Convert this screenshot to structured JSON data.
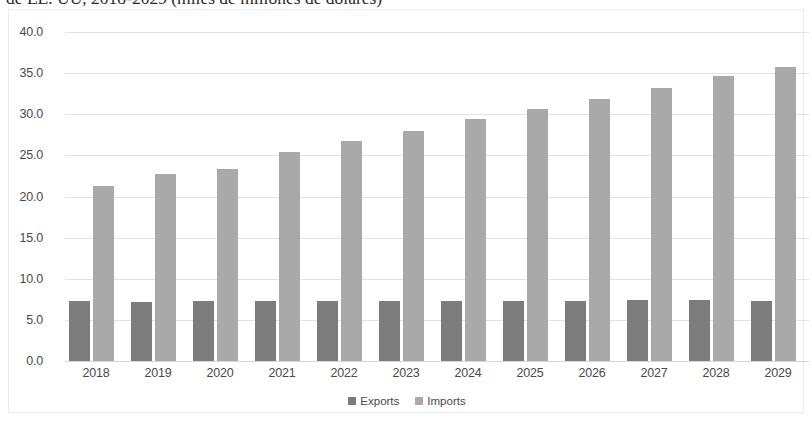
{
  "chart_data": {
    "type": "bar",
    "title": "de EE. UU, 2018-2029 (miles de millones de dólares)",
    "xlabel": "",
    "ylabel": "",
    "ylim": [
      0,
      40
    ],
    "ytick_step": 5,
    "grid": true,
    "legend_position": "bottom",
    "categories": [
      "2018",
      "2019",
      "2020",
      "2021",
      "2022",
      "2023",
      "2024",
      "2025",
      "2026",
      "2027",
      "2028",
      "2029"
    ],
    "ytick_labels": [
      "0.0",
      "5.0",
      "10.0",
      "15.0",
      "20.0",
      "25.0",
      "30.0",
      "35.0",
      "40.0"
    ],
    "series": [
      {
        "name": "Exports",
        "color": "#7c7c7c",
        "values": [
          7.3,
          7.2,
          7.3,
          7.3,
          7.3,
          7.3,
          7.3,
          7.3,
          7.3,
          7.4,
          7.4,
          7.3
        ]
      },
      {
        "name": "Imports",
        "color": "#a9a9a9",
        "values": [
          21.3,
          22.7,
          23.3,
          25.4,
          26.7,
          28.0,
          29.4,
          30.7,
          31.9,
          33.2,
          34.6,
          35.8
        ]
      }
    ]
  },
  "colors": {
    "exports": "#7c7c7c",
    "imports": "#a9a9a9",
    "gridline": "#e4e2e0",
    "axis_text": "#4a4a4a",
    "plot_border": "#eceaea",
    "background": "#ffffff"
  }
}
